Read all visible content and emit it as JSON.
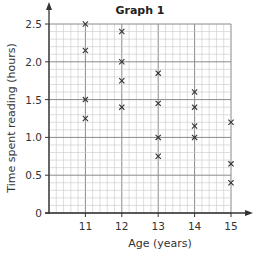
{
  "chart_data": {
    "type": "scatter",
    "title": "Graph 1",
    "xlabel": "Age (years)",
    "ylabel": "Time spent reading (hours)",
    "xlim": [
      10,
      15
    ],
    "ylim": [
      0,
      2.5
    ],
    "x_ticks": [
      11,
      12,
      13,
      14,
      15
    ],
    "y_ticks": [
      0,
      0.5,
      1.0,
      1.5,
      2.0,
      2.5
    ],
    "y_tick_labels": [
      "0",
      "0.5",
      "1.0",
      "1.5",
      "2.0",
      "2.5"
    ],
    "grid": true,
    "marker": "x",
    "series": [
      {
        "name": "Students",
        "points": [
          {
            "x": 11,
            "y": 2.5
          },
          {
            "x": 11,
            "y": 2.15
          },
          {
            "x": 11,
            "y": 1.5
          },
          {
            "x": 11,
            "y": 1.25
          },
          {
            "x": 12,
            "y": 2.4
          },
          {
            "x": 12,
            "y": 2.0
          },
          {
            "x": 12,
            "y": 1.75
          },
          {
            "x": 12,
            "y": 1.4
          },
          {
            "x": 13,
            "y": 1.85
          },
          {
            "x": 13,
            "y": 1.45
          },
          {
            "x": 13,
            "y": 1.0
          },
          {
            "x": 13,
            "y": 0.75
          },
          {
            "x": 14,
            "y": 1.6
          },
          {
            "x": 14,
            "y": 1.4
          },
          {
            "x": 14,
            "y": 1.15
          },
          {
            "x": 14,
            "y": 1.0
          },
          {
            "x": 15,
            "y": 1.2
          },
          {
            "x": 15,
            "y": 0.65
          },
          {
            "x": 15,
            "y": 0.4
          }
        ]
      }
    ],
    "colors": {
      "axis": "#333333",
      "major_grid": "#8a8a8a",
      "minor_grid": "#c8c8c8",
      "marker": "#333333"
    }
  }
}
